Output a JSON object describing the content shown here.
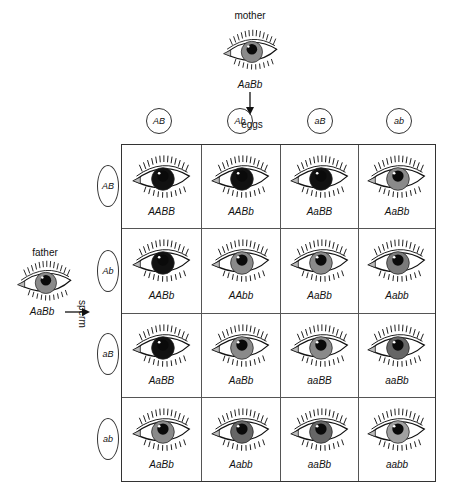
{
  "mother": {
    "label": "mother",
    "genotype": "AaBb",
    "iris_color": "#8a8a8a"
  },
  "father": {
    "label": "father",
    "genotype": "AaBb",
    "iris_color": "#8a8a8a"
  },
  "eggs_label": "eggs",
  "sperm_label": "sperm",
  "egg_gametes": [
    "AB",
    "Ab",
    "aB",
    "ab"
  ],
  "sperm_gametes": [
    "AB",
    "Ab",
    "aB",
    "ab"
  ],
  "colors": {
    "black": "#111111",
    "dark_gray": "#5a5a5a",
    "mid_gray": "#7f7f7f",
    "light_gray": "#9c9c9c",
    "lightest_gray": "#b0b0b0",
    "line": "#333333"
  },
  "grid": [
    [
      {
        "genotype": "AABB",
        "iris": "#111111"
      },
      {
        "genotype": "AABb",
        "iris": "#111111"
      },
      {
        "genotype": "AaBB",
        "iris": "#111111"
      },
      {
        "genotype": "AaBb",
        "iris": "#8a8a8a"
      }
    ],
    [
      {
        "genotype": "AABb",
        "iris": "#111111"
      },
      {
        "genotype": "AAbb",
        "iris": "#8a8a8a"
      },
      {
        "genotype": "AaBb",
        "iris": "#8a8a8a"
      },
      {
        "genotype": "Aabb",
        "iris": "#7a7a7a"
      }
    ],
    [
      {
        "genotype": "AaBB",
        "iris": "#111111"
      },
      {
        "genotype": "AaBb",
        "iris": "#8a8a8a"
      },
      {
        "genotype": "aaBB",
        "iris": "#8a8a8a"
      },
      {
        "genotype": "aaBb",
        "iris": "#666666"
      }
    ],
    [
      {
        "genotype": "AaBb",
        "iris": "#8a8a8a"
      },
      {
        "genotype": "Aabb",
        "iris": "#666666"
      },
      {
        "genotype": "aaBb",
        "iris": "#666666"
      },
      {
        "genotype": "aabb",
        "iris": "#a0a0a0"
      }
    ]
  ]
}
